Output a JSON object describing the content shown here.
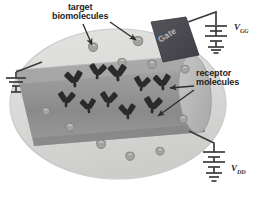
{
  "figure": {
    "type": "scientific-diagram"
  },
  "labels": {
    "target_line1": "target",
    "target_line2": "biomolecules",
    "receptor_line1": "receptor",
    "receptor_line2": "molecules",
    "gate": "Gate",
    "v_gate": "V",
    "v_gate_sub": "GG",
    "v_drain": "V",
    "v_drain_sub": "DD"
  },
  "colors": {
    "droplet": "#d8d8d6",
    "droplet_edge": "#b6b6b4",
    "channel_top": "#a9a9a9",
    "channel_body": "#8f8f8f",
    "channel_cap": "#bdbdbd",
    "gate_block": "#4a4a50",
    "molecule": "#2b2b2b",
    "target_blob": "#a3a3a1",
    "wire": "#3c3c3c",
    "text": "#1d1d1d"
  },
  "elements": {
    "droplet_name": "solution-droplet",
    "channel_name": "nanowire-channel",
    "gate_name": "gate-electrode",
    "ground_left": "ground-symbol-left",
    "ground_top": "ground-symbol-top-right",
    "ground_bottom": "ground-symbol-bottom-right",
    "battery_top": "battery-gate-supply",
    "battery_bottom": "battery-drain-supply"
  },
  "receptor_molecules": [
    {
      "x": 75,
      "y": 86,
      "r": -8,
      "s": 1.05
    },
    {
      "x": 97,
      "y": 78,
      "r": 6,
      "s": 1.0
    },
    {
      "x": 118,
      "y": 80,
      "r": -4,
      "s": 1.08
    },
    {
      "x": 141,
      "y": 90,
      "r": 8,
      "s": 0.95
    },
    {
      "x": 163,
      "y": 89,
      "r": -6,
      "s": 1.02
    },
    {
      "x": 66,
      "y": 106,
      "r": 4,
      "s": 1.0
    },
    {
      "x": 89,
      "y": 112,
      "r": -7,
      "s": 0.92
    },
    {
      "x": 108,
      "y": 106,
      "r": 5,
      "s": 1.0
    },
    {
      "x": 128,
      "y": 118,
      "r": -5,
      "s": 0.98
    },
    {
      "x": 152,
      "y": 112,
      "r": 7,
      "s": 1.06
    }
  ],
  "target_blobs": [
    {
      "x": 93,
      "y": 48,
      "s": 1.0
    },
    {
      "x": 138,
      "y": 42,
      "s": 1.05
    },
    {
      "x": 122,
      "y": 63,
      "s": 0.9
    },
    {
      "x": 152,
      "y": 65,
      "s": 0.95
    },
    {
      "x": 185,
      "y": 70,
      "s": 0.9
    },
    {
      "x": 70,
      "y": 128,
      "s": 0.95
    },
    {
      "x": 101,
      "y": 145,
      "s": 1.0
    },
    {
      "x": 130,
      "y": 157,
      "s": 0.95
    },
    {
      "x": 160,
      "y": 152,
      "s": 0.9
    },
    {
      "x": 46,
      "y": 112,
      "s": 0.85
    },
    {
      "x": 183,
      "y": 120,
      "s": 0.9
    }
  ],
  "pointer_arrows": [
    {
      "name": "arrow-target-left",
      "x1": 83,
      "y1": 24,
      "x2": 92,
      "y2": 45
    },
    {
      "name": "arrow-target-right",
      "x1": 110,
      "y1": 22,
      "x2": 136,
      "y2": 40
    },
    {
      "name": "arrow-receptor-1",
      "x1": 194,
      "y1": 86,
      "x2": 170,
      "y2": 88
    },
    {
      "name": "arrow-receptor-2",
      "x1": 194,
      "y1": 90,
      "x2": 158,
      "y2": 116
    }
  ]
}
